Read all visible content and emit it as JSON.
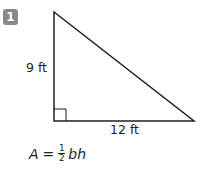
{
  "problem": {
    "number": "1",
    "badge_color": "#8a8a8a"
  },
  "figure": {
    "shape": "right-triangle",
    "height_label": "9 ft",
    "base_label": "12 ft",
    "right_angle_marker": true,
    "stroke_color": "#231f20"
  },
  "formula": {
    "lhs": "A",
    "equals": "=",
    "frac_num": "1",
    "frac_den": "2",
    "rhs": "bh"
  }
}
